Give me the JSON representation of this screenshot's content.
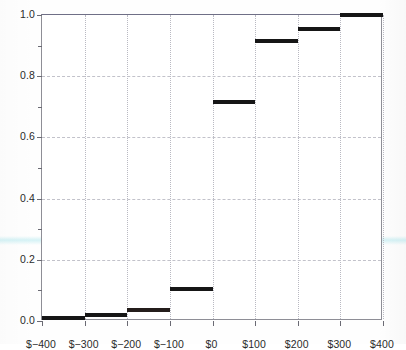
{
  "chart_data": {
    "type": "line",
    "subtype": "step-cdf",
    "title": "",
    "xlabel": "",
    "ylabel": "",
    "xlim": [
      -400,
      400
    ],
    "ylim": [
      0.0,
      1.0
    ],
    "grid": true,
    "legend": null,
    "x_tick_labels": [
      "$−400",
      "$−300",
      "$−200",
      "$−100",
      "$0",
      "$100",
      "$200",
      "$300",
      "$400"
    ],
    "x_tick_values": [
      -400,
      -300,
      -200,
      -100,
      0,
      100,
      200,
      300,
      400
    ],
    "y_tick_labels": [
      "0.0",
      "0.2",
      "0.4",
      "0.6",
      "0.8",
      "1.0"
    ],
    "y_tick_values": [
      0.0,
      0.2,
      0.4,
      0.6,
      0.8,
      1.0
    ],
    "y_minor_tick_values": [
      0.1,
      0.3,
      0.5,
      0.7,
      0.9
    ],
    "bin_edges": [
      -400,
      -300,
      -200,
      -100,
      0,
      100,
      200,
      300,
      400
    ],
    "values": [
      0.01,
      0.018,
      0.035,
      0.105,
      0.715,
      0.915,
      0.955,
      1.0
    ],
    "steps": [
      {
        "x0": -400,
        "x1": -300,
        "y": 0.01
      },
      {
        "x0": -300,
        "x1": -200,
        "y": 0.018
      },
      {
        "x0": -200,
        "x1": -100,
        "y": 0.035
      },
      {
        "x0": -100,
        "x1": 0,
        "y": 0.105
      },
      {
        "x0": 0,
        "x1": 100,
        "y": 0.715
      },
      {
        "x0": 100,
        "x1": 200,
        "y": 0.915
      },
      {
        "x0": 200,
        "x1": 300,
        "y": 0.955
      },
      {
        "x0": 300,
        "x1": 400,
        "y": 1.0
      }
    ],
    "colors": {
      "step": "#161616",
      "axis": "#8e8e96",
      "grid_vertical": "#b9b9c2",
      "grid_horizontal": "#c2c2ca",
      "tick_label": "#2b2b2b",
      "background": "#ffffff",
      "scan_tint": "#cef0f4"
    }
  }
}
